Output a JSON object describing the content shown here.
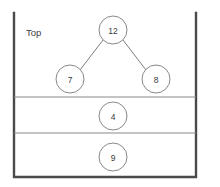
{
  "diagram": {
    "title_label": "Top",
    "container": {
      "left_x": 14,
      "right_x": 196,
      "bottom_y": 177,
      "top_y": 13,
      "open_top": true,
      "border_color": "#4a4a4a"
    },
    "divider_color": "#8a8a8a",
    "node_stroke_color": "#7a7a7a",
    "node_fill_color": "#ffffff",
    "edge_color": "#6e6e6e",
    "text_color": "#3a3a3a",
    "node_radius": 14,
    "dividers": [
      {
        "name": "divider-one",
        "y": 97
      },
      {
        "name": "divider-two",
        "y": 133
      }
    ],
    "compartments": [
      {
        "name": "compartment-top",
        "nodes": [
          {
            "id": "node-12",
            "label": "12",
            "cx": 113,
            "cy": 30,
            "role": "root"
          },
          {
            "id": "node-7",
            "label": "7",
            "cx": 70,
            "cy": 79,
            "role": "left-child"
          },
          {
            "id": "node-8",
            "label": "8",
            "cx": 156,
            "cy": 79,
            "role": "right-child"
          }
        ],
        "edges": [
          {
            "id": "edge-12-7",
            "from": "node-12",
            "to": "node-7",
            "x1": 103,
            "y1": 40,
            "x2": 80,
            "y2": 70
          },
          {
            "id": "edge-12-8",
            "from": "node-12",
            "to": "node-8",
            "x1": 123,
            "y1": 40,
            "x2": 146,
            "y2": 70
          }
        ]
      },
      {
        "name": "compartment-middle",
        "nodes": [
          {
            "id": "node-4",
            "label": "4",
            "cx": 113,
            "cy": 116,
            "role": "root"
          }
        ],
        "edges": []
      },
      {
        "name": "compartment-bottom",
        "nodes": [
          {
            "id": "node-9",
            "label": "9",
            "cx": 113,
            "cy": 157,
            "role": "root"
          }
        ],
        "edges": []
      }
    ],
    "label_position": {
      "x": 26,
      "y": 32
    }
  }
}
